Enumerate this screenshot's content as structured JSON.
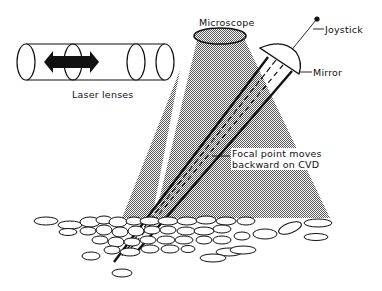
{
  "figure": {
    "type": "schematic diagram"
  },
  "labels": {
    "microscope": "Microscope",
    "joystick": "Joystick",
    "mirror": "Mirror",
    "laser_lenses": "Laser lenses",
    "focal_point_line1": "Focal point moves",
    "focal_point_line2": "backward on CVD"
  },
  "components": [
    {
      "name": "laser-lens-tube",
      "description": "Cylinder containing four lens ellipses with a double-headed arrow indicating lens movement"
    },
    {
      "name": "microscope-objective",
      "description": "Ellipse at top emitting a stippled light cone downward"
    },
    {
      "name": "mirror",
      "description": "Half-dome mirror tilted, attached to joystick rod"
    },
    {
      "name": "joystick",
      "description": "Thin rod ending in a dot at top-right"
    },
    {
      "name": "laser-beams",
      "description": "Converging solid and dashed beams going diagonally from mirror down-left to the tissue"
    },
    {
      "name": "cvd-tissue",
      "description": "Cluster of cobblestone-like cell outlines at bottom"
    }
  ],
  "colors": {
    "ink": "#111111",
    "stipple": "#8a8a8a",
    "background": "#ffffff"
  }
}
